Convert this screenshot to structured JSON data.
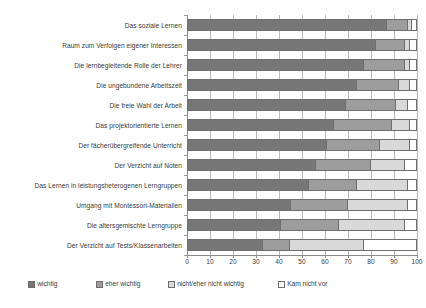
{
  "chart_data": {
    "type": "bar",
    "orientation": "horizontal",
    "stacked": true,
    "normalized": true,
    "title": "",
    "subtitle": "",
    "xlabel": "",
    "ylabel": "",
    "xlim": [
      0,
      100
    ],
    "xticks": [
      0,
      10,
      20,
      30,
      40,
      50,
      60,
      70,
      80,
      90,
      100
    ],
    "grid": true,
    "legend_position": "bottom",
    "categories": [
      "Das soziale Lernen",
      "Raum zum Verfolgen eigener Interessen",
      "Die lernbegleitende Rolle der Lehrer",
      "Die ungebundene Arbeitszeit",
      "Die freie Wahl der Arbeit",
      "Das projektorientierte Lernen",
      "Der fächerübergreifende Unterricht",
      "Der Verzicht auf Noten",
      "Das Lernen in leistungsheterogenen Lerngruppen",
      "Umgang mit Montessori-Materialien",
      "Die altersgemischte Lerngruppe",
      "Der Verzicht auf Tests/Klassenarbeiten"
    ],
    "series": [
      {
        "name": "wichtig",
        "color": "#777777",
        "values": [
          87,
          82,
          77,
          74,
          69,
          64,
          61,
          56,
          53,
          45,
          41,
          33
        ]
      },
      {
        "name": "eher wichtig",
        "color": "#9d9d9d",
        "values": [
          9,
          13,
          18,
          18,
          22,
          25,
          23,
          24,
          21,
          25,
          25,
          12
        ]
      },
      {
        "name": "nicht/eher nicht wichtig",
        "color": "#d9d9d9",
        "values": [
          2,
          2,
          2,
          5,
          5,
          8,
          13,
          15,
          22,
          26,
          29,
          32
        ]
      },
      {
        "name": "Kam nicht vor",
        "color": "#ffffff",
        "values": [
          2,
          3,
          3,
          3,
          4,
          3,
          3,
          5,
          4,
          4,
          5,
          23
        ]
      }
    ]
  },
  "legend": {
    "items": [
      {
        "label": "wichtig"
      },
      {
        "label": "eher wichtig"
      },
      {
        "label": "nicht/eher nicht wichtig"
      },
      {
        "label": "Kam nicht vor"
      }
    ]
  }
}
